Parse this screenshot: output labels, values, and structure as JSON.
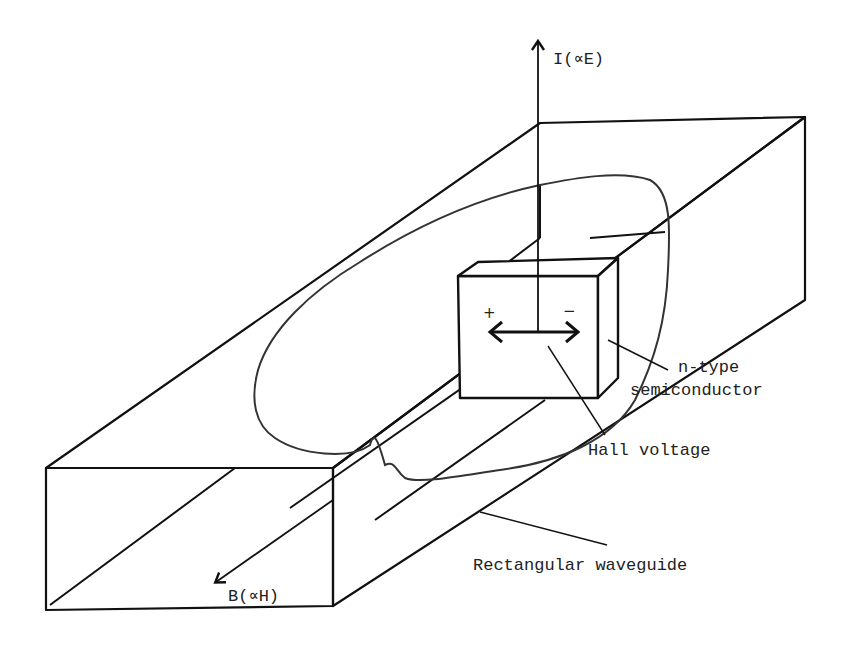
{
  "diagram": {
    "title": "",
    "labels": {
      "current": "I(∝E)",
      "magnetic": "B(∝H)",
      "semiconductor_line1": "n-type",
      "semiconductor_line2": "semiconductor",
      "hall_voltage": "Hall voltage",
      "waveguide": "Rectangular waveguide",
      "plus": "+",
      "minus": "−"
    },
    "colors": {
      "line": "#111111",
      "text": "#222222",
      "background": "#ffffff"
    }
  }
}
